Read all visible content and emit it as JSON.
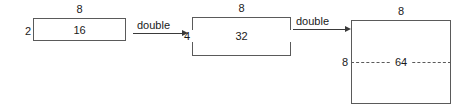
{
  "diagram": {
    "line_color": "#5a5a5a",
    "text_color": "#1a1a1a",
    "background": "#ffffff",
    "stages": [
      {
        "id": "stage-1",
        "width_label": "8",
        "height_label": "2",
        "area_label": "16",
        "has_mid_dashed_line": false
      },
      {
        "id": "stage-2",
        "width_label": "8",
        "height_label": "4",
        "area_label": "32",
        "has_mid_dashed_line": true
      },
      {
        "id": "stage-3",
        "width_label": "8",
        "height_label": "8",
        "area_label": "64",
        "has_mid_dashed_line": true
      }
    ],
    "arrows": [
      {
        "id": "arrow-1",
        "label": "double",
        "direction": "right"
      },
      {
        "id": "arrow-2",
        "label": "double",
        "direction": "right"
      }
    ]
  }
}
